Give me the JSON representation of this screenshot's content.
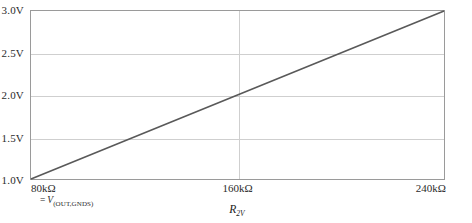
{
  "chart_data": {
    "type": "line",
    "title": "",
    "xlabel": "R2V",
    "ylabel": "",
    "xlim": [
      80,
      240
    ],
    "ylim": [
      1.0,
      3.0
    ],
    "grid": true,
    "legend": "none",
    "x_tick_labels": [
      "80kΩ",
      "160kΩ",
      "240kΩ"
    ],
    "x_tick_values": [
      80,
      160,
      240
    ],
    "y_tick_labels": [
      "1.0V",
      "1.5V",
      "2.0V",
      "2.5V",
      "3.0V"
    ],
    "y_tick_values": [
      1.0,
      1.5,
      2.0,
      2.5,
      3.0
    ],
    "series": [
      {
        "name": "V(OUT,GNDS)",
        "x": [
          80,
          160,
          240
        ],
        "values": [
          1.0,
          2.0,
          3.0
        ],
        "color": "#595959"
      }
    ],
    "annotations": [
      {
        "name": "series-definition",
        "equals": "=",
        "symbol": "V",
        "subscript": "(OUT,GNDS)"
      }
    ]
  },
  "axis": {
    "x_title_symbol": "R",
    "x_title_subscript": "2V"
  },
  "colors": {
    "line": "#595959",
    "grid": "#cfcfcf",
    "frame": "#9a9a9a",
    "text": "#2b2b2b",
    "background": "#ffffff"
  }
}
